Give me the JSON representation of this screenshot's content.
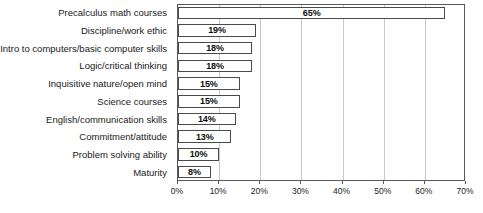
{
  "chart_data": {
    "type": "bar",
    "orientation": "horizontal",
    "title": "",
    "xlabel": "",
    "ylabel": "",
    "xlim": [
      0,
      70
    ],
    "xticks": [
      0,
      10,
      20,
      30,
      40,
      50,
      60,
      70
    ],
    "xtick_labels": [
      "0%",
      "10%",
      "20%",
      "30%",
      "40%",
      "50%",
      "60%",
      "70%"
    ],
    "grid": true,
    "legend": false,
    "categories": [
      "Precalculus math courses",
      "Discipline/work ethic",
      "Intro to computers/basic computer skills",
      "Logic/critical thinking",
      "Inquisitive nature/open mind",
      "Science courses",
      "English/communication skills",
      "Commitment/attitude",
      "Problem solving ability",
      "Maturity"
    ],
    "values": [
      65,
      19,
      18,
      18,
      15,
      15,
      14,
      13,
      10,
      8
    ],
    "data_labels": [
      "65%",
      "19%",
      "18%",
      "18%",
      "15%",
      "15%",
      "14%",
      "13%",
      "10%",
      "8%"
    ],
    "colors": {
      "bar_fill": "#ffffff",
      "bar_border": "#4a4a4a",
      "gridline": "#c8c8c8",
      "axis": "#5a5a5a",
      "text": "#1a1a1a"
    }
  }
}
